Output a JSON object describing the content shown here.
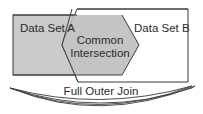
{
  "diagram": {
    "set_a": {
      "label": "Data Set A",
      "fill": "#cbcbcb"
    },
    "set_b": {
      "label": "Data Set B",
      "fill": "#ffffff"
    },
    "intersection": {
      "line1": "Common",
      "line2": "Intersection",
      "fill": "#c4c4c4"
    },
    "bracket": {
      "label": "Full Outer Join"
    },
    "stroke_color": "#3a3a3a"
  }
}
